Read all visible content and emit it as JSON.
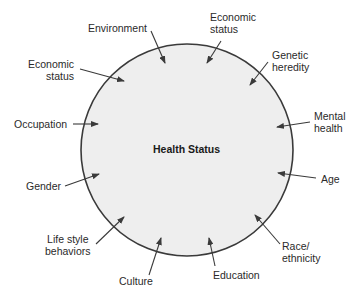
{
  "diagram": {
    "center_label": "Health Status",
    "circle": {
      "cx": 187,
      "cy": 150,
      "r": 106,
      "fill": "#eeeeee",
      "stroke": "#3a3a3a"
    },
    "factors": [
      {
        "id": "environment",
        "label": "Environment"
      },
      {
        "id": "economic-status-top",
        "label": "Economic\nstatus"
      },
      {
        "id": "genetic-heredity",
        "label": "Genetic\nheredity"
      },
      {
        "id": "economic-status-left",
        "label": "Economic\nstatus"
      },
      {
        "id": "occupation",
        "label": "Occupation"
      },
      {
        "id": "mental-health",
        "label": "Mental\nhealth"
      },
      {
        "id": "gender",
        "label": "Gender"
      },
      {
        "id": "age",
        "label": "Age"
      },
      {
        "id": "life-style-behaviors",
        "label": "Life style\nbehaviors"
      },
      {
        "id": "race-ethnicity",
        "label": "Race/\nethnicity"
      },
      {
        "id": "culture",
        "label": "Culture"
      },
      {
        "id": "education",
        "label": "Education"
      }
    ]
  }
}
